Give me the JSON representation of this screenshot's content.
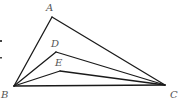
{
  "figure": {
    "points": {
      "A": {
        "x": 52,
        "y": 17,
        "label": "A",
        "label_x": 46,
        "label_y": 11
      },
      "D": {
        "x": 56,
        "y": 52,
        "label": "D",
        "label_x": 51,
        "label_y": 47
      },
      "E": {
        "x": 60,
        "y": 71,
        "label": "E",
        "label_x": 55,
        "label_y": 66
      },
      "B": {
        "x": 14,
        "y": 86,
        "label": "B",
        "label_x": 1,
        "label_y": 98
      },
      "C": {
        "x": 165,
        "y": 85,
        "label": "C",
        "label_x": 170,
        "label_y": 98
      }
    },
    "segments": [
      [
        "B",
        "A"
      ],
      [
        "A",
        "C"
      ],
      [
        "B",
        "D"
      ],
      [
        "D",
        "C"
      ],
      [
        "B",
        "E"
      ],
      [
        "E",
        "C"
      ],
      [
        "B",
        "C"
      ]
    ],
    "colors": {
      "line": "#1a1a1a",
      "label": "#555555",
      "background": "#ffffff"
    }
  }
}
